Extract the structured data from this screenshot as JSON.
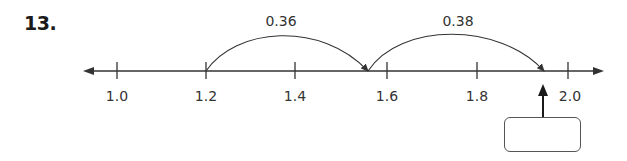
{
  "problem": {
    "number": "13."
  },
  "number_line": {
    "ticks": [
      {
        "value": 1.0,
        "label": "1.0",
        "x": 117
      },
      {
        "value": 1.2,
        "label": "1.2",
        "x": 206
      },
      {
        "value": 1.4,
        "label": "1.4",
        "x": 295
      },
      {
        "value": 1.6,
        "label": "1.6",
        "x": 387
      },
      {
        "value": 1.8,
        "label": "1.8",
        "x": 477
      },
      {
        "value": 2.0,
        "label": "2.0",
        "x": 568
      }
    ],
    "jumps": [
      {
        "from": 1.2,
        "to": 1.56,
        "label": "0.36"
      },
      {
        "from": 1.56,
        "to": 1.94,
        "label": "0.38"
      }
    ],
    "answer_pointer": {
      "value": 1.94,
      "answer": ""
    }
  },
  "colors": {
    "line": "#333333",
    "text": "#333333"
  }
}
